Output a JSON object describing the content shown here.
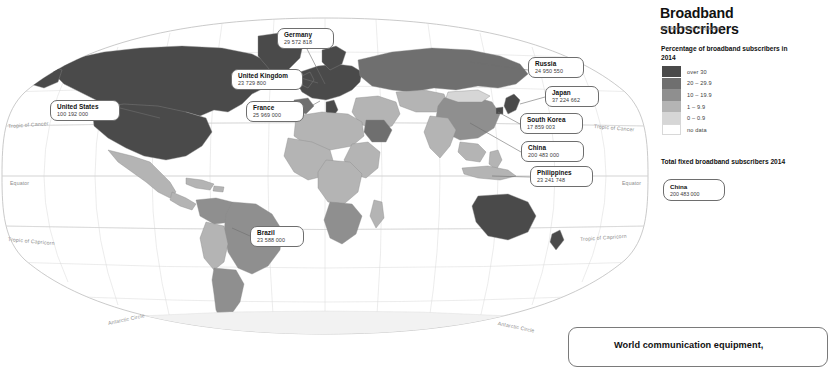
{
  "sidebar": {
    "title": "Broadband subscribers",
    "subtitle": "Winkel Tripel Projection",
    "legend_title": "Percentage of broadband subscribers in 2014",
    "legend": [
      {
        "label": "over 30",
        "color": "#4a4a4a"
      },
      {
        "label": "20 – 29.9",
        "color": "#6f6f6f"
      },
      {
        "label": "10 – 19.9",
        "color": "#8f8f8f"
      },
      {
        "label": "1 – 9.9",
        "color": "#b4b4b4"
      },
      {
        "label": "0 – 0.9",
        "color": "#d6d6d6"
      },
      {
        "label": "no data",
        "color": "#ffffff"
      }
    ],
    "total_title": "Total fixed broadband subscribers 2014",
    "total_box": {
      "name": "China",
      "value": "200 483 000"
    }
  },
  "map": {
    "graticule_labels": [
      {
        "text": "Tropic of Cancer",
        "x": 8,
        "y": 126,
        "rot": "rot-a"
      },
      {
        "text": "Equator",
        "x": 10,
        "y": 183,
        "rot": ""
      },
      {
        "text": "Tropic of Capricorn",
        "x": 8,
        "y": 239,
        "rot": "rot-b"
      },
      {
        "text": "Antarctic Circle",
        "x": 108,
        "y": 322,
        "rot": "rot-c"
      },
      {
        "text": "Tropic of Cancer",
        "x": 594,
        "y": 126,
        "rot": "rot-b"
      },
      {
        "text": "Equator",
        "x": 620,
        "y": 183,
        "rot": ""
      },
      {
        "text": "Tropic of Capricorn",
        "x": 592,
        "y": 239,
        "rot": "rot-a"
      },
      {
        "text": "Antarctic Circle",
        "x": 500,
        "y": 322,
        "rot": "rot-d"
      }
    ],
    "callouts": [
      {
        "name": "United States",
        "value": "100 192 000",
        "x": 50,
        "y": 100,
        "w": 70,
        "lx1": 120,
        "ly1": 108,
        "lx2": 160,
        "ly2": 118
      },
      {
        "name": "United Kingdom",
        "value": "23 729 800",
        "x": 231,
        "y": 69,
        "w": 70,
        "lx1": 301,
        "ly1": 78,
        "lx2": 318,
        "ly2": 83
      },
      {
        "name": "France",
        "value": "25 969 000",
        "x": 246,
        "y": 101,
        "w": 58,
        "lx1": 304,
        "ly1": 110,
        "lx2": 320,
        "ly2": 100
      },
      {
        "name": "Germany",
        "value": "29 572 818",
        "x": 277,
        "y": 28,
        "w": 56,
        "lx1": 306,
        "ly1": 47,
        "lx2": 325,
        "ly2": 84
      },
      {
        "name": "Russia",
        "value": "24 950 550",
        "x": 528,
        "y": 57,
        "w": 56,
        "lx1": 528,
        "ly1": 70,
        "lx2": 470,
        "ly2": 62
      },
      {
        "name": "Japan",
        "value": "37 224 662",
        "x": 545,
        "y": 86,
        "w": 54,
        "lx1": 545,
        "ly1": 97,
        "lx2": 520,
        "ly2": 104
      },
      {
        "name": "South Korea",
        "value": "17 859 003",
        "x": 520,
        "y": 113,
        "w": 62,
        "lx1": 520,
        "ly1": 124,
        "lx2": 498,
        "ly2": 112
      },
      {
        "name": "China",
        "value": "200 483 000",
        "x": 521,
        "y": 141,
        "w": 62,
        "lx1": 521,
        "ly1": 152,
        "lx2": 470,
        "ly2": 123
      },
      {
        "name": "Philippines",
        "value": "23 241 748",
        "x": 530,
        "y": 166,
        "w": 62,
        "lx1": 530,
        "ly1": 177,
        "lx2": 492,
        "ly2": 176
      },
      {
        "name": "Brazil",
        "value": "23 588 000",
        "x": 250,
        "y": 226,
        "w": 54,
        "lx1": 250,
        "ly1": 236,
        "lx2": 232,
        "ly2": 228
      }
    ]
  },
  "bottom": {
    "text": "World communication equipment,"
  }
}
